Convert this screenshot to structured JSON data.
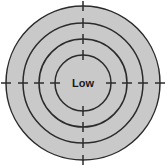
{
  "canvas": {
    "width": 167,
    "height": 167,
    "background": "#ffffff"
  },
  "diagram": {
    "center": {
      "x": 83,
      "y": 83
    },
    "fill_color": "#c9c9c9",
    "stroke_color": "#2b2b2b",
    "stroke_width": 1.5,
    "center_label": "Low",
    "center_label_color": "#1a1a1a",
    "center_label_size": 11,
    "tick_directions": [
      "north",
      "east",
      "south",
      "west"
    ],
    "tick_angles_deg": [
      270,
      0,
      90,
      180
    ],
    "tick_inner_overhang": 5,
    "tick_outer_overhang": 5,
    "tick_width": 1.5,
    "rings": [
      {
        "name": "ring-outer",
        "radius": 77,
        "level": 4
      },
      {
        "name": "ring-third",
        "radius": 60,
        "level": 3
      },
      {
        "name": "ring-second",
        "radius": 44,
        "level": 2
      },
      {
        "name": "ring-inner-center",
        "radius": 28,
        "level": 1
      }
    ]
  },
  "chart_data": {
    "type": "pie",
    "xlabel": "",
    "ylabel": "",
    "categories": [
      "ring-1-innermost",
      "ring-2",
      "ring-3",
      "ring-4-outermost"
    ],
    "values": [
      28,
      44,
      60,
      77
    ],
    "value_units": "radius in pixels",
    "annotations": [
      "Low"
    ],
    "legend": [],
    "grid": false
  }
}
